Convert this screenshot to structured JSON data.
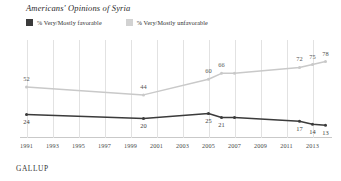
{
  "header": {
    "title": "Americans' Opinions of Syria"
  },
  "legend": {
    "items": [
      {
        "label": "% Very/Mostly favorable",
        "color": "#3b3b3b",
        "key": "favorable"
      },
      {
        "label": "% Very/Mostly unfavorable",
        "color": "#d2d2d2",
        "key": "unfavorable"
      }
    ]
  },
  "source": {
    "label": "GALLUP"
  },
  "axis": {
    "x_ticks": [
      "1991",
      "1993",
      "1995",
      "1997",
      "1999",
      "2001",
      "2003",
      "2005",
      "2007",
      "2009",
      "2011",
      "2013"
    ]
  },
  "chart_data": {
    "type": "line",
    "title": "Americans' Opinions of Syria",
    "xlabel": "",
    "ylabel": "",
    "ylim": [
      0,
      100
    ],
    "xlim": [
      1990.5,
      2014.5
    ],
    "grid": true,
    "legend_position": "top-left",
    "x": [
      1991,
      2000,
      2005,
      2006,
      2007,
      2012,
      2013,
      2014
    ],
    "tick_labels": [
      "1991",
      "1993",
      "1995",
      "1997",
      "1999",
      "2001",
      "2003",
      "2005",
      "2007",
      "2009",
      "2011",
      "2013"
    ],
    "series": [
      {
        "name": "% Very/Mostly favorable",
        "color": "#3b3b3b",
        "values": [
          24,
          20,
          25,
          21,
          21,
          17,
          14,
          13
        ],
        "point_labels": [
          "24",
          "20",
          "25",
          "21",
          "",
          "17",
          "14",
          "13"
        ]
      },
      {
        "name": "% Very/Mostly unfavorable",
        "color": "#c9c9c9",
        "values": [
          52,
          44,
          60,
          66,
          66,
          72,
          75,
          78
        ],
        "point_labels": [
          "52",
          "44",
          "60",
          "66",
          "",
          "72",
          "75",
          "78"
        ]
      }
    ]
  }
}
